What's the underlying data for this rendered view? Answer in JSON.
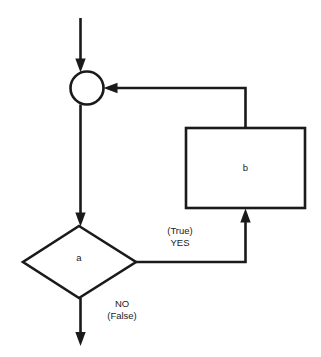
{
  "diagram": {
    "background_color": "#ffffff",
    "stroke_color": "#1a1a1a",
    "nodes": [
      {
        "id": "junction",
        "type": "connector-circle",
        "label": "",
        "cx": 87,
        "cy": 88,
        "r": 17
      },
      {
        "id": "condition",
        "type": "decision-diamond",
        "label": "a",
        "cx": 79,
        "cy": 262,
        "half_width": 57,
        "half_height": 36
      },
      {
        "id": "body",
        "type": "process-rectangle",
        "label": "b",
        "x": 186,
        "y": 128,
        "width": 119,
        "height": 80
      }
    ],
    "edges": [
      {
        "id": "entry",
        "from": "",
        "to": "junction",
        "label": "",
        "arrow": true
      },
      {
        "id": "junction-to-condition",
        "from": "junction",
        "to": "condition",
        "label": "",
        "arrow": true
      },
      {
        "id": "condition-true",
        "from": "condition",
        "to": "body",
        "label_line1": "(True)",
        "label_line2": "YES",
        "arrow": true
      },
      {
        "id": "body-to-junction",
        "from": "body",
        "to": "junction",
        "label": "",
        "arrow": true
      },
      {
        "id": "condition-false",
        "from": "condition",
        "to": "",
        "label_line1": "NO",
        "label_line2": "(False)",
        "arrow": true
      }
    ],
    "labels": {
      "node_a": "a",
      "node_b": "b",
      "true_paren": "(True)",
      "true_word": "YES",
      "false_word": "NO",
      "false_paren": "(False)"
    }
  }
}
